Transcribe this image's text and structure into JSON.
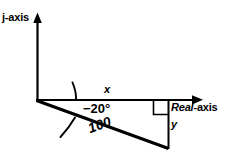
{
  "diagram": {
    "type": "phasor-diagram",
    "background_color": "#ffffff",
    "stroke_color": "#000000",
    "axes": {
      "vertical": {
        "label": "j-axis",
        "icon": "up-arrow-icon",
        "origin": [
          37,
          100
        ],
        "tip": [
          37,
          13
        ]
      },
      "horizontal": {
        "label_italic_part": "Real",
        "label_plain_part": "-axis",
        "label_full": "Real-axis",
        "icon": "right-arrow-icon",
        "origin": [
          37,
          100
        ],
        "tip": [
          203,
          100
        ]
      }
    },
    "vector": {
      "magnitude_label": "100",
      "angle_label": "−20°",
      "angle_degrees": -20,
      "start": [
        37,
        100
      ],
      "end": [
        168,
        148
      ]
    },
    "components": {
      "real_component_label": "x",
      "imaginary_component_label": "y",
      "right_angle_marker": "right-angle-square"
    }
  }
}
